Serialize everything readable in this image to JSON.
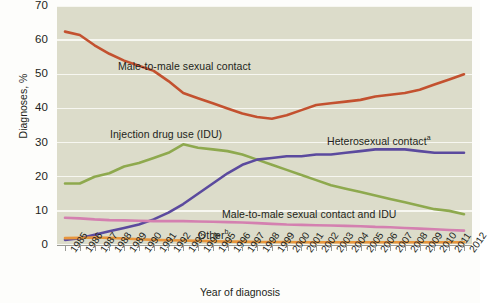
{
  "chart_data": {
    "type": "line",
    "title": "",
    "xlabel": "Year of diagnosis",
    "ylabel": "Diagnoses, %",
    "ylim": [
      0,
      70
    ],
    "yticks": [
      0,
      10,
      20,
      30,
      40,
      50,
      60,
      70
    ],
    "grid": true,
    "legend_position": "inline-annotations",
    "x": [
      1985,
      1986,
      1987,
      1988,
      1989,
      1990,
      1991,
      1992,
      1993,
      1994,
      1995,
      1996,
      1997,
      1998,
      1999,
      2000,
      2001,
      2002,
      2003,
      2004,
      2005,
      2006,
      2007,
      2008,
      2009,
      2010,
      2011,
      2012
    ],
    "categories": [
      "1985",
      "1986",
      "1987",
      "1988",
      "1989",
      "1990",
      "1991",
      "1992",
      "1993",
      "1994",
      "1995",
      "1996",
      "1997",
      "1998",
      "1999",
      "2000",
      "2001",
      "2002",
      "2003",
      "2004",
      "2005",
      "2006",
      "2007",
      "2008",
      "2009",
      "2010",
      "2011",
      "2012"
    ],
    "series": [
      {
        "name": "Male-to-male sexual contact",
        "color": "#c3512f",
        "label": "Male-to-male sexual contact",
        "values": [
          62.5,
          61.5,
          58.5,
          56.0,
          54.0,
          52.5,
          51.0,
          48.0,
          44.5,
          43.0,
          41.5,
          40.0,
          38.5,
          37.5,
          37.0,
          38.0,
          39.5,
          41.0,
          41.5,
          42.0,
          42.5,
          43.5,
          44.0,
          44.5,
          45.5,
          47.0,
          48.5,
          50.0
        ]
      },
      {
        "name": "Injection drug use (IDU)",
        "color": "#8ea94e",
        "label": "Injection drug use (IDU)",
        "values": [
          18.0,
          18.0,
          20.0,
          21.0,
          23.0,
          24.0,
          25.5,
          27.0,
          29.5,
          28.5,
          28.0,
          27.5,
          26.5,
          25.0,
          23.5,
          22.0,
          20.5,
          19.0,
          17.5,
          16.5,
          15.5,
          14.5,
          13.5,
          12.5,
          11.5,
          10.5,
          10.0,
          9.0
        ]
      },
      {
        "name": "Heterosexual contact",
        "color": "#5b4a9e",
        "label": "Heterosexual contact",
        "superscript": "a",
        "values": [
          1.5,
          2.0,
          3.0,
          4.0,
          5.0,
          6.0,
          7.5,
          9.5,
          12.0,
          15.0,
          18.0,
          21.0,
          23.5,
          25.0,
          25.5,
          26.0,
          26.0,
          26.5,
          26.5,
          27.0,
          27.5,
          28.0,
          28.0,
          28.0,
          27.5,
          27.0,
          27.0,
          27.0
        ]
      },
      {
        "name": "Male-to-male sexual contact and IDU",
        "color": "#d480b0",
        "label": "Male-to-male sexual contact and IDU",
        "values": [
          8.0,
          7.8,
          7.5,
          7.3,
          7.2,
          7.1,
          7.0,
          7.0,
          7.0,
          6.9,
          6.8,
          6.7,
          6.6,
          6.4,
          6.2,
          6.0,
          5.9,
          5.8,
          5.7,
          5.6,
          5.5,
          5.3,
          5.2,
          5.0,
          4.8,
          4.6,
          4.4,
          4.2
        ]
      },
      {
        "name": "Other",
        "color": "#e8963c",
        "label": "Other",
        "superscript": "b",
        "values": [
          2.0,
          2.1,
          2.2,
          2.1,
          1.9,
          1.7,
          1.5,
          1.4,
          1.3,
          1.2,
          1.1,
          1.0,
          1.0,
          0.9,
          0.9,
          0.9,
          0.8,
          0.8,
          0.8,
          0.8,
          0.8,
          0.8,
          0.8,
          0.8,
          0.8,
          0.8,
          0.8,
          0.8
        ]
      }
    ],
    "annotations": [
      {
        "text": "Male-to-male sexual contact",
        "x": 118,
        "y": 60
      },
      {
        "text": "Injection drug use (IDU)",
        "x": 110,
        "y": 128
      },
      {
        "text": "Heterosexual contact",
        "sup": "a",
        "x": 327,
        "y": 134
      },
      {
        "text": "Male-to-male sexual contact and IDU",
        "x": 222,
        "y": 208
      },
      {
        "text": "Other",
        "sup": "b",
        "x": 198,
        "y": 228
      }
    ],
    "colors": {
      "plot_background": "#dcdcca",
      "gridline": "#f7f7f1",
      "axis": "#9a9a94",
      "text": "#231f20"
    }
  }
}
